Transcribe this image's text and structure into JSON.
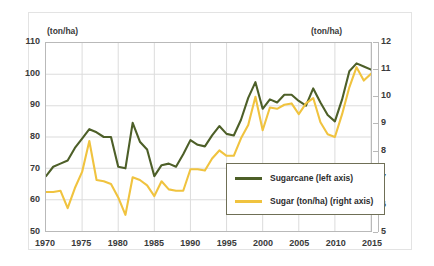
{
  "chart_data": {
    "type": "line",
    "title": "",
    "xlabel": "",
    "ylabel": "(ton/ha)",
    "y2label": "(ton/ha)",
    "xlim": [
      1970,
      2015
    ],
    "ylim": [
      50,
      110
    ],
    "y2lim": [
      5,
      12
    ],
    "grid": true,
    "legend_position": "inside-lower-right",
    "xticks": [
      1970,
      1975,
      1980,
      1985,
      1990,
      1995,
      2000,
      2005,
      2010,
      2015
    ],
    "yticks": [
      50,
      60,
      70,
      80,
      90,
      100,
      110
    ],
    "y2ticks": [
      5,
      6,
      7,
      8,
      9,
      10,
      11,
      12
    ],
    "x": [
      1970,
      1971,
      1972,
      1973,
      1974,
      1975,
      1976,
      1977,
      1978,
      1979,
      1980,
      1981,
      1982,
      1983,
      1984,
      1985,
      1986,
      1987,
      1988,
      1989,
      1990,
      1991,
      1992,
      1993,
      1994,
      1995,
      1996,
      1997,
      1998,
      1999,
      2000,
      2001,
      2002,
      2003,
      2004,
      2005,
      2006,
      2007,
      2008,
      2009,
      2010,
      2011,
      2012,
      2013,
      2014,
      2015
    ],
    "series": [
      {
        "name": "Sugarcane (left axis)",
        "axis": "left",
        "color": "#4d5f28",
        "values": [
          67.5,
          70.5,
          71.5,
          72.5,
          76.5,
          79.5,
          82.5,
          81.5,
          80.0,
          80.0,
          70.5,
          70.0,
          84.5,
          78.5,
          76.0,
          67.5,
          71.0,
          71.5,
          70.5,
          74.5,
          79.0,
          77.5,
          77.0,
          80.5,
          83.5,
          81.0,
          80.5,
          85.5,
          92.5,
          97.5,
          89.0,
          92.0,
          91.0,
          93.5,
          93.5,
          91.5,
          90.0,
          95.5,
          91.0,
          87.0,
          85.0,
          92.0,
          101.0,
          103.5,
          102.5,
          101.5
        ]
      },
      {
        "name": "Sugar  (ton/ha) (right axis)",
        "axis": "right",
        "color": "#f0c33f",
        "values": [
          6.45,
          6.45,
          6.5,
          5.85,
          6.6,
          7.2,
          8.35,
          6.9,
          6.85,
          6.75,
          6.25,
          5.6,
          7.0,
          6.9,
          6.7,
          6.3,
          6.85,
          6.55,
          6.5,
          6.5,
          7.3,
          7.3,
          7.25,
          7.7,
          8.0,
          7.8,
          7.8,
          8.45,
          8.95,
          10.0,
          8.75,
          9.6,
          9.55,
          9.7,
          9.75,
          9.35,
          9.75,
          9.95,
          9.05,
          8.6,
          8.5,
          9.35,
          10.35,
          11.1,
          10.6,
          10.85
        ]
      }
    ]
  },
  "axes": {
    "left_unit": "(ton/ha)",
    "right_unit": "(ton/ha)"
  },
  "legend": {
    "entries": [
      {
        "label": "Sugarcane (left axis)",
        "color": "#4d5f28"
      },
      {
        "label": "Sugar  (ton/ha) (right axis)",
        "color": "#f0c33f"
      }
    ]
  }
}
